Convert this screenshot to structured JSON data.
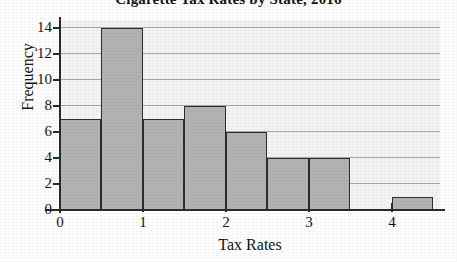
{
  "chart_data": {
    "type": "bar",
    "title": "Cigarette Tax Rates by State, 2016",
    "xlabel": "Tax Rates",
    "ylabel": "Frequency",
    "xlim": [
      0,
      4.58
    ],
    "ylim": [
      0,
      14.6
    ],
    "grid": true,
    "legend": false,
    "bin_width": 0.5,
    "bins": [
      {
        "start": 0.0,
        "end": 0.5,
        "value": 7
      },
      {
        "start": 0.5,
        "end": 1.0,
        "value": 14
      },
      {
        "start": 1.0,
        "end": 1.5,
        "value": 7
      },
      {
        "start": 1.5,
        "end": 2.0,
        "value": 8
      },
      {
        "start": 2.0,
        "end": 2.5,
        "value": 6
      },
      {
        "start": 2.5,
        "end": 3.0,
        "value": 4
      },
      {
        "start": 3.0,
        "end": 3.5,
        "value": 4
      },
      {
        "start": 3.5,
        "end": 4.0,
        "value": 0
      },
      {
        "start": 4.0,
        "end": 4.5,
        "value": 1
      }
    ],
    "categories": [
      "0-0.5",
      "0.5-1",
      "1-1.5",
      "1.5-2",
      "2-2.5",
      "2.5-3",
      "3-3.5",
      "3.5-4",
      "4-4.5"
    ],
    "values": [
      7,
      14,
      7,
      8,
      6,
      4,
      4,
      0,
      1
    ],
    "x_ticks": [
      0,
      1,
      2,
      3,
      4
    ],
    "x_tick_labels": [
      "0",
      "1",
      "2",
      "3",
      "4"
    ],
    "y_ticks": [
      0,
      2,
      4,
      6,
      8,
      10,
      12,
      14
    ],
    "y_tick_labels": [
      "0",
      "2",
      "4",
      "6",
      "8",
      "10",
      "12",
      "14"
    ],
    "colors": {
      "bar_fill": "#b3b3b3",
      "bar_edge": "#2d2d2d",
      "plot_background": "#f4f4f4",
      "gridline": "#9b9b9b",
      "axis": "#2b2b2b",
      "text": "#141414"
    }
  }
}
